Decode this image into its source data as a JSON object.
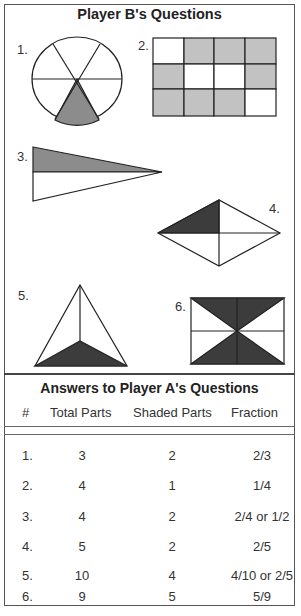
{
  "questions_section": {
    "title": "Player B's Questions",
    "labels": [
      "1.",
      "2.",
      "3.",
      "4.",
      "5.",
      "6."
    ],
    "shade_colors": {
      "light": "#c2c2c2",
      "medium": "#8c8c8c",
      "dark": "#3c3c3c"
    }
  },
  "answers_section": {
    "title": "Answers to Player A's Questions",
    "columns": [
      "#",
      "Total Parts",
      "Shaded Parts",
      "Fraction"
    ],
    "rows": [
      {
        "num": "1.",
        "total": "3",
        "shaded": "2",
        "fraction": "2/3"
      },
      {
        "num": "2.",
        "total": "4",
        "shaded": "1",
        "fraction": "1/4"
      },
      {
        "num": "3.",
        "total": "4",
        "shaded": "2",
        "fraction": "2/4 or 1/2"
      },
      {
        "num": "4.",
        "total": "5",
        "shaded": "2",
        "fraction": "2/5"
      },
      {
        "num": "5.",
        "total": "10",
        "shaded": "4",
        "fraction": "4/10 or 2/5"
      },
      {
        "num": "6.",
        "total": "9",
        "shaded": "5",
        "fraction": "5/9"
      }
    ]
  }
}
